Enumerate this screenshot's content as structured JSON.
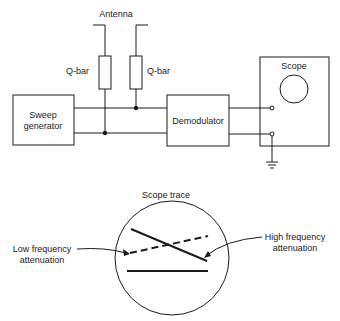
{
  "circuit": {
    "antenna_label": "Antenna",
    "qbar_left_label": "Q-bar",
    "qbar_right_label": "Q-bar",
    "sweep_generator": {
      "line1": "Sweep",
      "line2": "generator"
    },
    "demodulator_label": "Demodulator",
    "scope_label": "Scope"
  },
  "trace": {
    "title": "Scope trace",
    "low_freq": {
      "line1": "Low frequency",
      "line2": "attenuation"
    },
    "high_freq": {
      "line1": "High frequency",
      "line2": "attenuation"
    }
  },
  "colors": {
    "line": "#1a1a1a",
    "background": "#ffffff"
  }
}
